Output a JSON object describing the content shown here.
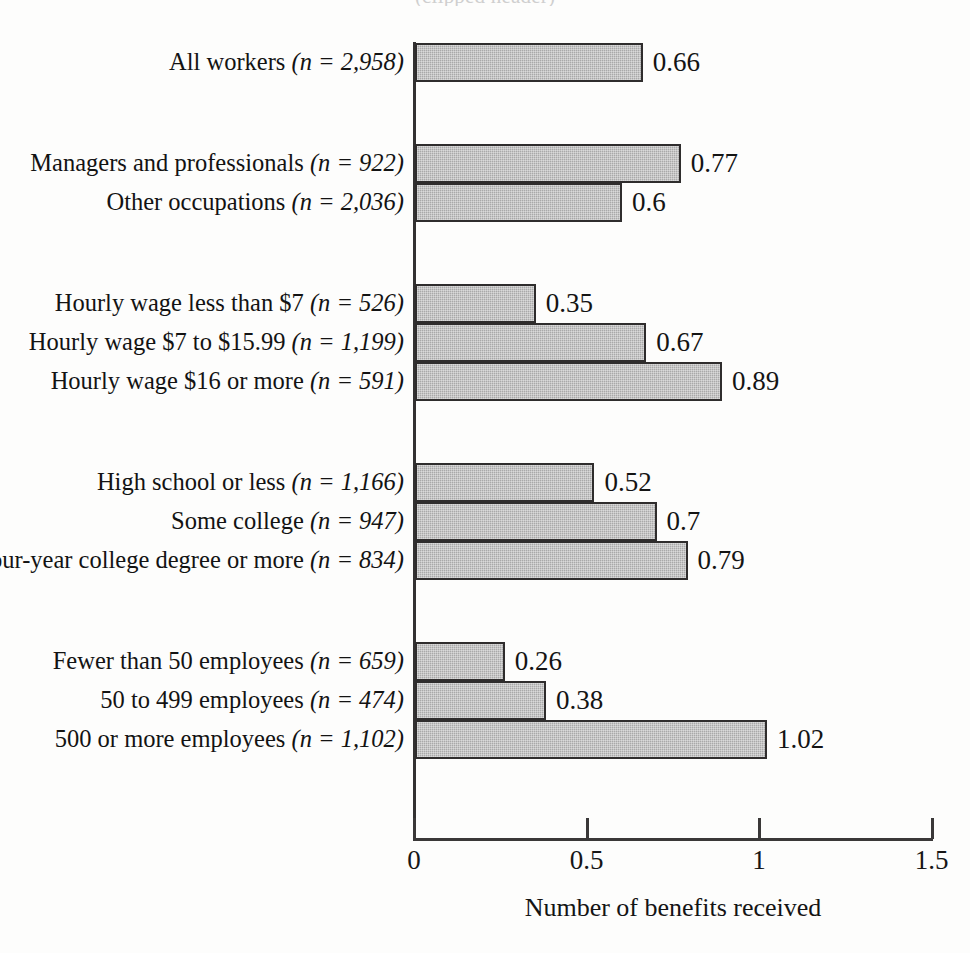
{
  "title_partial": "(clipped header)",
  "chart_data": {
    "type": "bar",
    "orientation": "horizontal",
    "title": "",
    "xlabel": "Number of benefits received",
    "ylabel": "",
    "xlim": [
      0,
      1.5
    ],
    "xticks": [
      "0",
      "0.5",
      "1",
      "1.5"
    ],
    "xtick_values": [
      0,
      0.5,
      1,
      1.5
    ],
    "grid": false,
    "legend": null,
    "bar_color": "#a9a9a9",
    "bar_edge_color": "#2f2d2d",
    "groups": [
      {
        "name": "overall",
        "rows": [
          {
            "label_main": "All workers ",
            "label_n": "(n = 2,958)",
            "value": 0.66,
            "value_label": "0.66"
          }
        ]
      },
      {
        "name": "occupation",
        "rows": [
          {
            "label_main": "Managers and professionals ",
            "label_n": "(n = 922)",
            "value": 0.77,
            "value_label": "0.77"
          },
          {
            "label_main": "Other occupations ",
            "label_n": "(n = 2,036)",
            "value": 0.6,
            "value_label": "0.6"
          }
        ]
      },
      {
        "name": "hourly-wage",
        "rows": [
          {
            "label_main": "Hourly wage less than $7 ",
            "label_n": "(n = 526)",
            "value": 0.35,
            "value_label": "0.35"
          },
          {
            "label_main": "Hourly wage $7 to $15.99 ",
            "label_n": "(n = 1,199)",
            "value": 0.67,
            "value_label": "0.67"
          },
          {
            "label_main": "Hourly wage $16 or more ",
            "label_n": "(n = 591)",
            "value": 0.89,
            "value_label": "0.89"
          }
        ]
      },
      {
        "name": "education",
        "rows": [
          {
            "label_main": "High school or less ",
            "label_n": "(n = 1,166)",
            "value": 0.52,
            "value_label": "0.52"
          },
          {
            "label_main": "Some college ",
            "label_n": "(n = 947)",
            "value": 0.7,
            "value_label": "0.7"
          },
          {
            "label_main": "Four-year college degree or more ",
            "label_n": "(n = 834)",
            "value": 0.79,
            "value_label": "0.79"
          }
        ]
      },
      {
        "name": "employer-size",
        "rows": [
          {
            "label_main": "Fewer than 50 employees ",
            "label_n": "(n = 659)",
            "value": 0.26,
            "value_label": "0.26"
          },
          {
            "label_main": "50 to 499 employees ",
            "label_n": "(n = 474)",
            "value": 0.38,
            "value_label": "0.38"
          },
          {
            "label_main": "500 or more employees ",
            "label_n": "(n = 1,102)",
            "value": 1.02,
            "value_label": "1.02"
          }
        ]
      }
    ]
  }
}
